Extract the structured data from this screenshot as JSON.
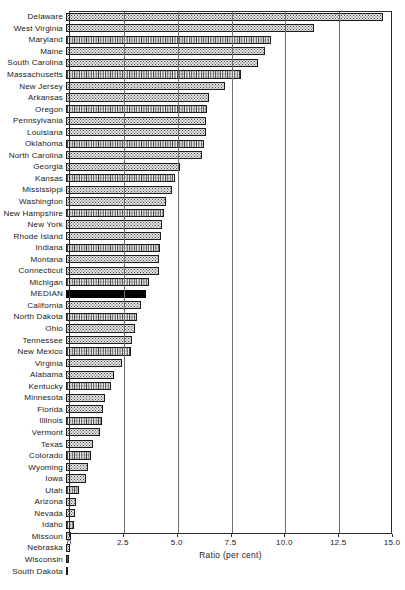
{
  "chart_data": {
    "type": "bar",
    "orientation": "horizontal",
    "title": "",
    "xlabel": "Ratio (per cent)",
    "ylabel": "",
    "xlim": [
      0,
      15.0
    ],
    "xticks": [
      0,
      2.5,
      5.0,
      7.5,
      10.0,
      12.5,
      15.0
    ],
    "xtick_labels": [
      "0",
      "2.5",
      "5.0",
      "7.5",
      "10.0",
      "12.5",
      "15.0"
    ],
    "grid": true,
    "grid_axis": "x",
    "legend": null,
    "highlight_category": "MEDIAN",
    "highlight_color": "#000000",
    "bar_fill_color": "#e3e3e3",
    "bar_edge_color": "#1c1c1c",
    "categories": [
      "Delaware",
      "West Virginia",
      "Maryland",
      "Maine",
      "South Carolina",
      "Massachusetts",
      "New Jersey",
      "Arkansas",
      "Oregon",
      "Pennsylvania",
      "Louisiana",
      "Oklahoma",
      "North Carolina",
      "Georgia",
      "Kansas",
      "Mississippi",
      "Washington",
      "New Hampshire",
      "New York",
      "Rhode Island",
      "Indiana",
      "Montana",
      "Connecticut",
      "Michigan",
      "MEDIAN",
      "California",
      "North Dakota",
      "Ohio",
      "Tennessee",
      "New Mexico",
      "Virginia",
      "Alabama",
      "Kentucky",
      "Minnesota",
      "Florida",
      "Illinois",
      "Vermont",
      "Texas",
      "Colorado",
      "Wyoming",
      "Iowa",
      "Utah",
      "Arizona",
      "Nevada",
      "Idaho",
      "Missouri",
      "Nebraska",
      "Wisconsin",
      "South Dakota"
    ],
    "values": [
      14.7,
      11.5,
      9.5,
      9.25,
      8.9,
      8.15,
      7.4,
      6.65,
      6.55,
      6.5,
      6.5,
      6.4,
      6.3,
      5.3,
      5.05,
      4.9,
      4.65,
      4.55,
      4.45,
      4.4,
      4.35,
      4.3,
      4.3,
      3.85,
      3.7,
      3.5,
      3.3,
      3.2,
      3.05,
      3.0,
      2.6,
      2.25,
      2.1,
      1.8,
      1.7,
      1.65,
      1.6,
      1.25,
      1.15,
      1.0,
      0.95,
      0.6,
      0.45,
      0.42,
      0.35,
      0.22,
      0.2,
      0.12,
      0.1
    ]
  }
}
